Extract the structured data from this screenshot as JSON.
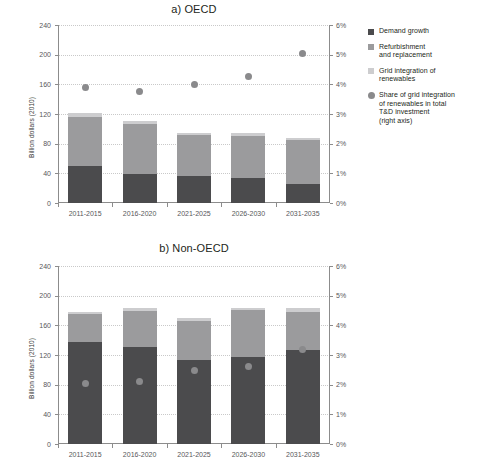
{
  "chart_data": [
    {
      "type": "bar",
      "panel": "a",
      "title": "a) OECD",
      "categories": [
        "2011-2015",
        "2016-2020",
        "2021-2025",
        "2026-2030",
        "2031-2035"
      ],
      "xlabel": "",
      "ylabel": "Billion dollars (2010)",
      "ylim": [
        0,
        240
      ],
      "yticks": [
        0,
        40,
        80,
        120,
        160,
        200,
        240
      ],
      "ytick_labels": [
        "0",
        "40",
        "80",
        "120",
        "160",
        "200",
        "240"
      ],
      "y2lim": [
        0,
        6
      ],
      "y2ticks": [
        0,
        1,
        2,
        3,
        4,
        5,
        6
      ],
      "y2tick_labels": [
        "0%",
        "1%",
        "2%",
        "3%",
        "4%",
        "5%",
        "6%"
      ],
      "grid": true,
      "stacked": true,
      "series": [
        {
          "name": "Demand growth",
          "color": "#4b4b4d",
          "values": [
            50,
            39,
            37,
            34,
            25
          ]
        },
        {
          "name": "Refurbishment and replacement",
          "color": "#9b9b9d",
          "values": [
            66,
            68,
            55,
            56,
            60
          ]
        },
        {
          "name": "Grid integration of renewables",
          "color": "#cdcdcf",
          "values": [
            5,
            3,
            3,
            4,
            3
          ]
        }
      ],
      "scatter": {
        "name": "Share of grid integration of renewables in total T&D investment (right axis)",
        "color": "#8a8a8c",
        "axis": "right",
        "values": [
          3.9,
          3.75,
          4.0,
          4.25,
          5.05
        ]
      }
    },
    {
      "type": "bar",
      "panel": "b",
      "title": "b) Non-OECD",
      "categories": [
        "2011-2015",
        "2016-2020",
        "2021-2025",
        "2026-2030",
        "2031-2035"
      ],
      "xlabel": "",
      "ylabel": "Billion dollars (2010)",
      "ylim": [
        0,
        240
      ],
      "yticks": [
        0,
        40,
        80,
        120,
        160,
        200,
        240
      ],
      "ytick_labels": [
        "0",
        "40",
        "80",
        "120",
        "160",
        "200",
        "240"
      ],
      "y2lim": [
        0,
        6
      ],
      "y2ticks": [
        0,
        1,
        2,
        3,
        4,
        5,
        6
      ],
      "y2tick_labels": [
        "0%",
        "1%",
        "2%",
        "3%",
        "4%",
        "5%",
        "6%"
      ],
      "grid": true,
      "stacked": true,
      "series": [
        {
          "name": "Demand growth",
          "color": "#4b4b4d",
          "values": [
            137,
            131,
            113,
            117,
            127
          ]
        },
        {
          "name": "Refurbishment and replacement",
          "color": "#9b9b9d",
          "values": [
            38,
            48,
            53,
            64,
            51
          ]
        },
        {
          "name": "Grid integration of renewables",
          "color": "#cdcdcf",
          "values": [
            3,
            4,
            4,
            3,
            5
          ]
        }
      ],
      "scatter": {
        "name": "Share of grid integration of renewables in total T&D investment (right axis)",
        "color": "#8a8a8c",
        "axis": "right",
        "values": [
          2.05,
          2.1,
          2.48,
          2.6,
          3.2
        ]
      }
    }
  ],
  "legend": {
    "items": [
      {
        "label": "Demand growth",
        "marker": "square",
        "color": "#4b4b4d"
      },
      {
        "label": "Refurbishment\nand replacement",
        "marker": "square",
        "color": "#9b9b9d"
      },
      {
        "label": "Grid integration of\nrenewables",
        "marker": "square",
        "color": "#cdcdcf"
      },
      {
        "label": "Share of grid integration\nof renewables in total\nT&D investment\n(right axis)",
        "marker": "circle",
        "color": "#8a8a8c"
      }
    ]
  }
}
